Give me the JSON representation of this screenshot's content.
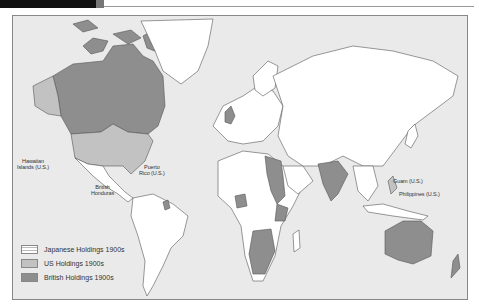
{
  "header": {
    "bar_color": "#111111"
  },
  "map": {
    "ocean_color": "#eaeaea",
    "land_color": "#ffffff",
    "labels": [
      {
        "id": "hawaii",
        "text": "Hawaiian\nIslands (U.S.)"
      },
      {
        "id": "british-honduras",
        "text": "British\nHonduras"
      },
      {
        "id": "puerto-rico",
        "text": "Puerto\nRico (U.S.)"
      },
      {
        "id": "guam",
        "text": "Guam (U.S.)"
      },
      {
        "id": "philippines",
        "text": "Philippines (U.S.)"
      }
    ]
  },
  "legend": {
    "items": [
      {
        "label": "Japanese Holdings 1900s",
        "color": "#ffffff",
        "pattern": "striped"
      },
      {
        "label": "US Holdings 1900s",
        "color": "#c2c2c2"
      },
      {
        "label": "British Holdings 1900s",
        "color": "#8e8e8e"
      }
    ]
  }
}
